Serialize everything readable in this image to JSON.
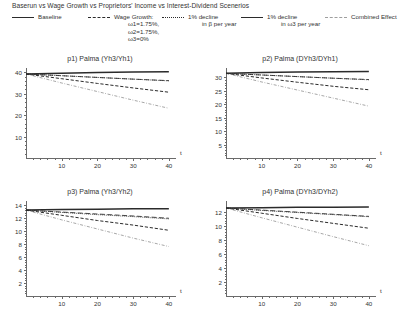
{
  "header": {
    "title": "Baserun vs Wage Growth vs Proprietors' Income vs Interest-Dividend Scenerios"
  },
  "legend": {
    "position": "top",
    "items": [
      {
        "label": "Baseline",
        "sub": [],
        "style": "solid"
      },
      {
        "label": "Wage Growth:",
        "sub": [
          "ω1=1.75%,",
          "ω2=1.75%,",
          "ω3=0%"
        ],
        "style": "dashed"
      },
      {
        "label": "1% decline",
        "sub": [
          "in β per year"
        ],
        "style": "dotted"
      },
      {
        "label": "1% decline",
        "sub": [
          "in ω3 per year"
        ],
        "style": "long-dash"
      },
      {
        "label": "Combined Effect",
        "sub": [],
        "style": "dash-dot"
      }
    ]
  },
  "chart_data": [
    {
      "type": "line",
      "title": "p1) Palma (Yh3/Yh1)",
      "xlabel": "t",
      "ylabel": "",
      "xlim": [
        0,
        42
      ],
      "ylim": [
        0,
        42
      ],
      "xticks": [
        10,
        20,
        30,
        40
      ],
      "yticks": [
        10,
        20,
        30,
        40
      ],
      "grid": false,
      "x": [
        0,
        10,
        20,
        30,
        40
      ],
      "series": [
        {
          "name": "Baseline",
          "style": "solid",
          "values": [
            39.2,
            39.6,
            39.9,
            40.1,
            40.3
          ]
        },
        {
          "name": "Wage Growth",
          "style": "dashed",
          "values": [
            39.2,
            37.0,
            34.8,
            32.7,
            30.7
          ]
        },
        {
          "name": "1% decline in β",
          "style": "dotted",
          "values": [
            39.2,
            38.4,
            37.6,
            36.8,
            36.0
          ]
        },
        {
          "name": "1% decline in ω3",
          "style": "long-dash",
          "values": [
            39.2,
            38.4,
            37.6,
            36.8,
            36.1
          ]
        },
        {
          "name": "Combined Effect",
          "style": "dash-dot",
          "values": [
            39.2,
            35.0,
            31.0,
            27.0,
            23.2
          ]
        }
      ]
    },
    {
      "type": "line",
      "title": "p2) Palma (DYh3/DYh1)",
      "xlabel": "t",
      "ylabel": "",
      "xlim": [
        0,
        42
      ],
      "ylim": [
        0,
        33.5
      ],
      "xticks": [
        10,
        20,
        30,
        40
      ],
      "yticks": [
        5,
        10,
        15,
        20,
        25,
        30
      ],
      "grid": false,
      "x": [
        0,
        10,
        20,
        30,
        40
      ],
      "series": [
        {
          "name": "Baseline",
          "style": "solid",
          "values": [
            31.5,
            31.8,
            32.0,
            32.1,
            32.2
          ]
        },
        {
          "name": "Wage Growth",
          "style": "dashed",
          "values": [
            31.5,
            29.8,
            28.2,
            26.7,
            25.4
          ]
        },
        {
          "name": "1% decline in β",
          "style": "dotted",
          "values": [
            31.5,
            30.9,
            30.3,
            29.7,
            29.1
          ]
        },
        {
          "name": "1% decline in ω3",
          "style": "long-dash",
          "values": [
            31.5,
            30.9,
            30.3,
            29.7,
            29.2
          ]
        },
        {
          "name": "Combined Effect",
          "style": "dash-dot",
          "values": [
            31.5,
            28.3,
            25.3,
            22.3,
            19.3
          ]
        }
      ]
    },
    {
      "type": "line",
      "title": "p3) Palma (Yh3/Yh2)",
      "xlabel": "t",
      "ylabel": "",
      "xlim": [
        0,
        42
      ],
      "ylim": [
        0,
        14.6
      ],
      "xticks": [
        10,
        20,
        30,
        40
      ],
      "yticks": [
        2,
        4,
        6,
        8,
        10,
        12,
        14
      ],
      "grid": false,
      "x": [
        0,
        10,
        20,
        30,
        40
      ],
      "series": [
        {
          "name": "Baseline",
          "style": "solid",
          "values": [
            13.2,
            13.3,
            13.35,
            13.4,
            13.4
          ]
        },
        {
          "name": "Wage Growth",
          "style": "dashed",
          "values": [
            13.2,
            12.4,
            11.6,
            10.9,
            10.1
          ]
        },
        {
          "name": "1% decline in β",
          "style": "dotted",
          "values": [
            13.2,
            12.85,
            12.5,
            12.2,
            11.85
          ]
        },
        {
          "name": "1% decline in ω3",
          "style": "long-dash",
          "values": [
            13.2,
            12.9,
            12.6,
            12.3,
            11.95
          ]
        },
        {
          "name": "Combined Effect",
          "style": "dash-dot",
          "values": [
            13.2,
            11.7,
            10.3,
            8.9,
            7.6
          ]
        }
      ]
    },
    {
      "type": "line",
      "title": "p4) Palma (DYh3/DYh2)",
      "xlabel": "t",
      "ylabel": "",
      "xlim": [
        0,
        42
      ],
      "ylim": [
        0,
        13.6
      ],
      "xticks": [
        10,
        20,
        30,
        40
      ],
      "yticks": [
        2,
        4,
        6,
        8,
        10,
        12
      ],
      "grid": false,
      "x": [
        0,
        10,
        20,
        30,
        40
      ],
      "series": [
        {
          "name": "Baseline",
          "style": "solid",
          "values": [
            12.6,
            12.65,
            12.7,
            12.7,
            12.75
          ]
        },
        {
          "name": "Wage Growth",
          "style": "dashed",
          "values": [
            12.6,
            11.85,
            11.1,
            10.4,
            9.7
          ]
        },
        {
          "name": "1% decline in β",
          "style": "dotted",
          "values": [
            12.6,
            12.25,
            11.95,
            11.65,
            11.35
          ]
        },
        {
          "name": "1% decline in ω3",
          "style": "long-dash",
          "values": [
            12.6,
            12.3,
            12.0,
            11.7,
            11.4
          ]
        },
        {
          "name": "Combined Effect",
          "style": "dash-dot",
          "values": [
            12.6,
            11.2,
            9.85,
            8.5,
            7.2
          ]
        }
      ]
    }
  ]
}
